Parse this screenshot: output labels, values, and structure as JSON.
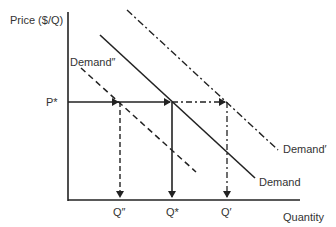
{
  "diagram": {
    "type": "supply-demand",
    "y_axis_label": "Price ($/Q)",
    "x_axis_label": "Quantity",
    "price_label": "P*",
    "quantity_labels": {
      "q_double_prime": "Q″",
      "q_star": "Q*",
      "q_prime": "Q′"
    },
    "curves": [
      {
        "name": "Demand",
        "style": "solid"
      },
      {
        "name": "Demand′",
        "style": "dash-dot"
      },
      {
        "name": "Demand″",
        "style": "dashed"
      }
    ],
    "line_color": "#222222"
  },
  "labels": {
    "demand": "Demand",
    "demand_prime": "Demand′",
    "demand_double_prime": "Demand″"
  }
}
